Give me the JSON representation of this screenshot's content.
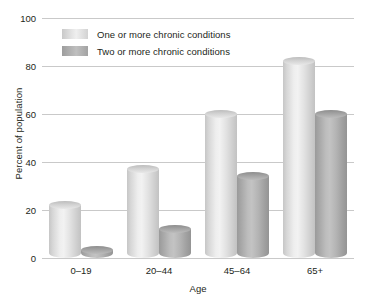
{
  "chart_data": {
    "type": "bar",
    "title": "",
    "subtitle": "",
    "xlabel": "Age",
    "ylabel": "Percent of population",
    "categories": [
      "0–19",
      "20–44",
      "45–64",
      "65+"
    ],
    "series": [
      {
        "name": "One or more chronic conditions",
        "values": [
          22,
          37,
          60,
          82
        ],
        "color": "#e2e2e2"
      },
      {
        "name": "Two or more chronic conditions",
        "values": [
          3.5,
          12,
          34,
          60
        ],
        "color": "#b0b0b0"
      }
    ],
    "ylim": [
      0,
      100
    ],
    "yticks": [
      0,
      20,
      40,
      60,
      80,
      100
    ],
    "ytick_labels": [
      "0",
      "20",
      "40",
      "60",
      "80",
      "100"
    ],
    "grid": "horizontal",
    "legend_position": "top-left-inside",
    "background_color": "#ffffff",
    "gridline_color": "#c9c9c9",
    "text_color": "#231f20"
  },
  "axes": {
    "y_title": "Percent of population",
    "x_title": "Age",
    "y_ticks": [
      {
        "label": "100",
        "value": 100
      },
      {
        "label": "80",
        "value": 80
      },
      {
        "label": "60",
        "value": 60
      },
      {
        "label": "40",
        "value": 40
      },
      {
        "label": "20",
        "value": 20
      },
      {
        "label": "0",
        "value": 0
      }
    ],
    "x_ticks": [
      {
        "label": "0–19"
      },
      {
        "label": "20–44"
      },
      {
        "label": "45–64"
      },
      {
        "label": "65+"
      }
    ]
  },
  "legend": {
    "items": [
      {
        "label": "One or more chronic conditions",
        "swatch": "light"
      },
      {
        "label": "Two or more chronic conditions",
        "swatch": "dark"
      }
    ]
  }
}
